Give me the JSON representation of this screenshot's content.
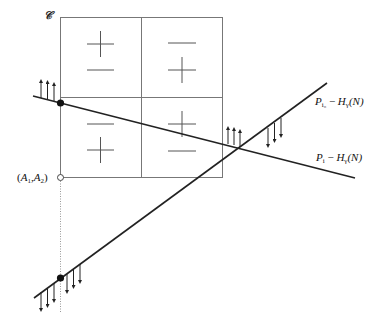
{
  "figure": {
    "region_label": "𝒞",
    "point_label": "(A1,A2)",
    "point_label_parts": {
      "open": "(",
      "a1": "A",
      "a1_sub": "1",
      "sep": ",",
      "a2": "A",
      "a2_sub": "2",
      "close": ")"
    },
    "lines": [
      {
        "id": "p-i0-line",
        "label": "P_i0 − H_γ(N)",
        "label_parts": {
          "p": "P",
          "p_sub": "i₀",
          "minus": " − ",
          "h": "H",
          "h_sub": "γ",
          "arg": "(N)"
        }
      },
      {
        "id": "p-i-line",
        "label": "P_i − H_γ(N)",
        "label_parts": {
          "p": "P",
          "p_sub": "i",
          "minus": " − ",
          "h": "H",
          "h_sub": "γ",
          "arg": "(N)"
        }
      }
    ],
    "quadrant_signs": {
      "top_left": [
        "+",
        "−"
      ],
      "top_right": [
        "−",
        "+"
      ],
      "bottom_left": [
        "−",
        "+"
      ],
      "bottom_right": [
        "+",
        "−"
      ]
    },
    "colors": {
      "grid": "#777777",
      "line": "#222222",
      "dot": "#111111",
      "dotted": "#999999"
    }
  }
}
